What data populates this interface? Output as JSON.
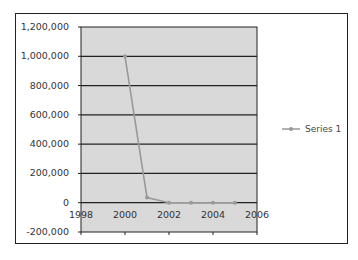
{
  "chart_data": {
    "type": "line",
    "title": "",
    "xlabel": "",
    "ylabel": "",
    "x": [
      2000,
      2001,
      2002,
      2003,
      2004,
      2005
    ],
    "series": [
      {
        "name": "Series 1",
        "values": [
          1000000,
          35000,
          0,
          0,
          0,
          0
        ],
        "color": "#999999"
      }
    ],
    "xlim": [
      1998,
      2006
    ],
    "ylim": [
      -200000,
      1200000
    ],
    "x_ticks": [
      "1998",
      "2000",
      "2002",
      "2004",
      "2006"
    ],
    "y_ticks": [
      "1,200,000",
      "1,000,000",
      "800,000",
      "600,000",
      "400,000",
      "200,000",
      "0",
      "-200,000"
    ],
    "grid": true,
    "plot_background": "#d9d9d9",
    "legend_position": "right"
  },
  "legend": {
    "label": "Series 1"
  }
}
